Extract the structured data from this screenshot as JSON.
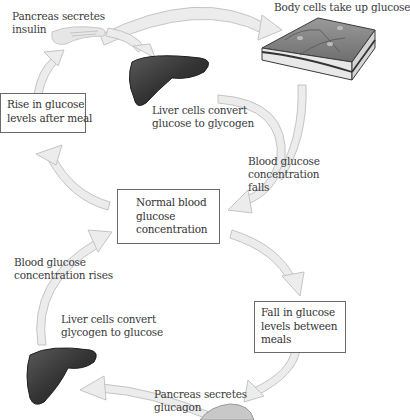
{
  "diagram": {
    "title": "",
    "colors": {
      "arrow_fill": "#ececec",
      "arrow_stroke": "#c4c4c4",
      "box_border": "#6a6a6a",
      "liver": "#3a3a3a",
      "text": "#3a3a3a"
    },
    "nodes": {
      "pancreas_insulin": {
        "lines": [
          "Pancreas secretes",
          "insulin"
        ]
      },
      "body_cells": {
        "lines": [
          "Body cells take up glucose"
        ]
      },
      "liver_glycogenesis": {
        "lines": [
          "Liver cells convert",
          "glucose to glycogen"
        ]
      },
      "rise_box": {
        "lines": [
          "Rise in glucose",
          "levels after meal"
        ]
      },
      "falls_label": {
        "lines": [
          "Blood glucose",
          "concentration",
          "falls"
        ]
      },
      "normal_box": {
        "lines": [
          "Normal blood",
          "glucose",
          "concentration"
        ]
      },
      "rises_label": {
        "lines": [
          "Blood glucose",
          "concentration rises"
        ]
      },
      "liver_glycogenolysis": {
        "lines": [
          "Liver cells convert",
          "glycogen to glucose"
        ]
      },
      "fall_box": {
        "lines": [
          "Fall in glucose",
          "levels between",
          "meals"
        ]
      },
      "pancreas_glucagon": {
        "lines": [
          "Pancreas secretes",
          "glucagon"
        ]
      }
    },
    "icons": {
      "pancreas_top": "pancreas-icon",
      "liver_top": "liver-icon",
      "cells": "tissue-cells-icon",
      "liver_bottom": "liver-icon",
      "pancreas_bottom": "pancreas-icon"
    }
  }
}
